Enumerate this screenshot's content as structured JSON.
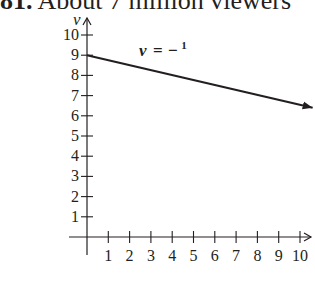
{
  "header": {
    "number": "81.",
    "text": "About 7 million viewers"
  },
  "chart_data": {
    "type": "line",
    "title": "",
    "xlabel": "Number of years since 2000",
    "xlabel_lines": [
      "Number of years",
      "since 2000"
    ],
    "ylabel": "Average number of viewers (in millions)",
    "ylabel_lines": [
      "Average number",
      "of viewers (in millions)"
    ],
    "x_var": "t",
    "y_var": "v",
    "xlim": [
      0,
      10.5
    ],
    "ylim": [
      0,
      10
    ],
    "x_ticks": [
      1,
      2,
      3,
      4,
      5,
      6,
      7,
      8,
      9,
      10
    ],
    "y_ticks": [
      1,
      2,
      3,
      4,
      5,
      6,
      7,
      8,
      9,
      10
    ],
    "grid": false,
    "equation": {
      "lhs": "v",
      "equals": "=",
      "sign": "−",
      "numerator": "1",
      "denominator": "4",
      "var": "t",
      "plus": "+",
      "constant": "9",
      "slope": -0.25,
      "intercept": 9
    },
    "series": [
      {
        "name": "v = -1/4 t + 9",
        "x": [
          0,
          1,
          2,
          3,
          4,
          5,
          6,
          7,
          8,
          9,
          10,
          10.5
        ],
        "values": [
          9,
          8.75,
          8.5,
          8.25,
          8,
          7.75,
          7.5,
          7.25,
          7,
          6.75,
          6.5,
          6.375
        ]
      }
    ]
  }
}
